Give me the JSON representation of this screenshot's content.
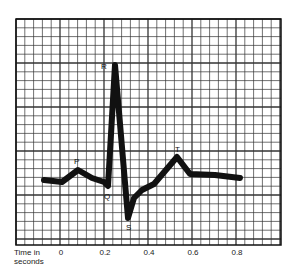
{
  "chart_data": {
    "type": "line",
    "title": "",
    "xlabel": "Time in seconds",
    "ylabel": "",
    "grid": true,
    "x_ticks": [
      "0",
      "0.2",
      "0.4",
      "0.6",
      "0.8"
    ],
    "xlim": [
      -0.2,
      1.0
    ],
    "wave_labels": [
      "P",
      "Q",
      "R",
      "S",
      "T"
    ],
    "series": [
      {
        "name": "ECG trace",
        "points": [
          {
            "t": -0.08,
            "v": 0.0
          },
          {
            "t": 0.02,
            "v": -0.02
          },
          {
            "t": 0.06,
            "v": 0.1,
            "label": "P"
          },
          {
            "t": 0.1,
            "v": 0.03
          },
          {
            "t": 0.18,
            "v": -0.01
          },
          {
            "t": 0.21,
            "v": -0.06,
            "label": "Q"
          },
          {
            "t": 0.245,
            "v": 1.3,
            "label": "R"
          },
          {
            "t": 0.3,
            "v": -0.4,
            "label": "S"
          },
          {
            "t": 0.36,
            "v": -0.12
          },
          {
            "t": 0.42,
            "v": -0.07
          },
          {
            "t": 0.53,
            "v": 0.25,
            "label": "T"
          },
          {
            "t": 0.58,
            "v": 0.07
          },
          {
            "t": 0.7,
            "v": 0.06
          },
          {
            "t": 0.82,
            "v": 0.02
          }
        ]
      }
    ]
  },
  "labels": {
    "P": "P",
    "Q": "Q",
    "R": "R",
    "S": "S",
    "T": "T",
    "axis_title_line1": "Time in",
    "axis_title_line2": "seconds",
    "tick_0": "0",
    "tick_02": "0.2",
    "tick_04": "0.4",
    "tick_06": "0.6",
    "tick_08": "0.8"
  },
  "colors": {
    "grid": "#333333",
    "trace": "#111111",
    "background": "#ffffff"
  }
}
